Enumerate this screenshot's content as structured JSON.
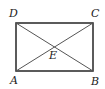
{
  "diagram": {
    "type": "geometry",
    "shape": "rectangle",
    "vertices": [
      {
        "name": "A",
        "label": "A",
        "x": 16,
        "y": 71
      },
      {
        "name": "B",
        "label": "B",
        "x": 93,
        "y": 71
      },
      {
        "name": "C",
        "label": "C",
        "x": 93,
        "y": 23
      },
      {
        "name": "D",
        "label": "D",
        "x": 16,
        "y": 23
      }
    ],
    "intersection": {
      "name": "E",
      "label": "E",
      "x": 54.5,
      "y": 47
    },
    "diagonals": [
      "AC",
      "BD"
    ],
    "labels": {
      "A": "A",
      "B": "B",
      "C": "C",
      "D": "D",
      "E": "E"
    }
  }
}
